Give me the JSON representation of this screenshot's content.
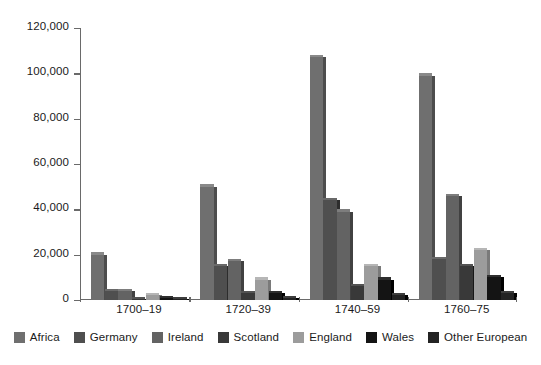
{
  "chart_data": {
    "type": "bar",
    "title": "",
    "subtitle": "",
    "xlabel": "",
    "ylabel": "",
    "categories": [
      "1700–19",
      "1720–39",
      "1740–59",
      "1760–75"
    ],
    "series": [
      {
        "name": "Africa",
        "color": "#6f6f6f",
        "values": [
          20000,
          50000,
          107000,
          99000
        ]
      },
      {
        "name": "Germany",
        "color": "#4f4f4f",
        "values": [
          4000,
          15000,
          44000,
          18000
        ]
      },
      {
        "name": "Ireland",
        "color": "#636363",
        "values": [
          4000,
          17000,
          39000,
          46000
        ]
      },
      {
        "name": "Scotland",
        "color": "#393939",
        "values": [
          500,
          3000,
          6000,
          15000
        ]
      },
      {
        "name": "England",
        "color": "#9c9c9c",
        "values": [
          2000,
          9000,
          15000,
          22000
        ]
      },
      {
        "name": "Wales",
        "color": "#141414",
        "values": [
          1000,
          3000,
          9000,
          10000
        ]
      },
      {
        "name": "Other European",
        "color": "#232323",
        "values": [
          500,
          1000,
          2000,
          3000
        ]
      }
    ],
    "ylim": [
      0,
      120000
    ],
    "yticks": [
      0,
      20000,
      40000,
      60000,
      80000,
      100000,
      120000
    ],
    "ytick_labels": [
      "0",
      "20,000",
      "40,000",
      "60,000",
      "80,000",
      "100,000",
      "120,000"
    ],
    "grid": false,
    "legend_position": "bottom",
    "axis_color": "#6a6a6a",
    "text_color": "#1a1a1a",
    "background": "#ffffff"
  }
}
